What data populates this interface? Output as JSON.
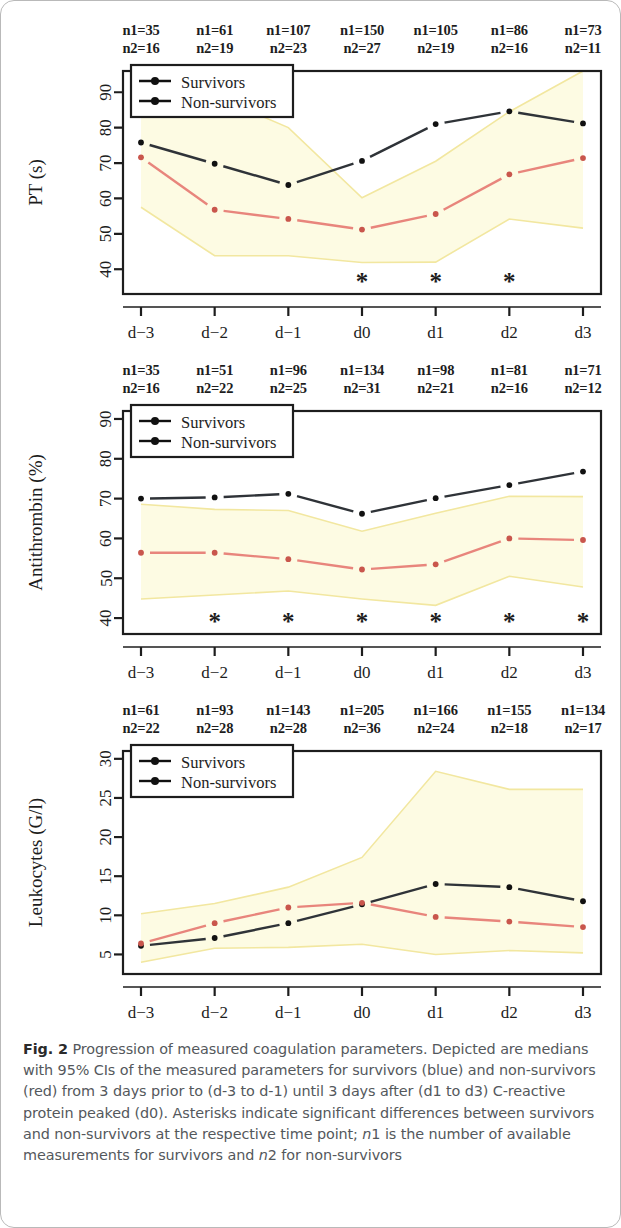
{
  "figure": {
    "label": "Fig. 2",
    "caption_parts": [
      "Progression of measured coagulation parameters. Depicted are medians with 95% CIs of the measured parameters for survivors (blue) and non-survivors (red) from 3 days prior to (d-3 to d-1) until 3 days after (d1 to d3) C-reactive protein peaked (d0). Asterisks indicate significant differences between survivors and non-survivors at the respective time point; ",
      "n",
      "1 is the number of available measurements for survivors and ",
      "n",
      "2 for non-survivors"
    ],
    "caption_full": "Progression of measured coagulation parameters. Depicted are medians with 95% CIs of the measured parameters for survivors (blue) and non-survivors (red) from 3 days prior to (d-3 to d-1) until 3 days after (d1 to d3) C-reactive protein peaked (d0). Asterisks indicate significant differences between survivors and non-survivors at the respective time point; n1 is the number of available measurements for survivors and n2 for non-survivors"
  },
  "legend": {
    "survivors": "Survivors",
    "non_survivors": "Non-survivors"
  },
  "colors": {
    "survivors_line": "#2f3338",
    "non_survivors_line": "#e8857c",
    "ci_band": "#fdfbe3",
    "ci_edge": "#f2e7a0",
    "axis": "#1d1d1d",
    "caption_text": "#54585c"
  },
  "chart_data": [
    {
      "type": "line",
      "title": "PT (s)",
      "ylabel": "PT (s)",
      "xlabel": "",
      "categories": [
        "d−3",
        "d−2",
        "d−1",
        "d0",
        "d1",
        "d2",
        "d3"
      ],
      "ylim": [
        33,
        96
      ],
      "yticks": [
        40,
        50,
        60,
        70,
        80,
        90
      ],
      "grid": false,
      "legend_position": "top-left",
      "series": [
        {
          "name": "Survivors",
          "values": [
            75.8,
            69.8,
            63.8,
            70.6,
            81.0,
            84.6,
            81.2
          ]
        },
        {
          "name": "Non-survivors",
          "values": [
            71.6,
            56.8,
            54.2,
            51.2,
            55.6,
            66.8,
            71.4
          ]
        }
      ],
      "ci_upper": [
        95.0,
        89.0,
        80.0,
        60.2,
        70.5,
        84.5,
        96.5
      ],
      "ci_lower": [
        57.5,
        43.8,
        43.8,
        41.9,
        42.0,
        54.2,
        51.6
      ],
      "n1": [
        35,
        61,
        107,
        150,
        105,
        86,
        73
      ],
      "n2": [
        16,
        19,
        23,
        27,
        19,
        16,
        11
      ],
      "significant": [
        false,
        false,
        false,
        true,
        true,
        true,
        false
      ],
      "asterisk": "*"
    },
    {
      "type": "line",
      "title": "Antithrombin (%)",
      "ylabel": "Antithrombin (%)",
      "xlabel": "",
      "categories": [
        "d−3",
        "d−2",
        "d−1",
        "d0",
        "d1",
        "d2",
        "d3"
      ],
      "ylim": [
        36,
        92
      ],
      "yticks": [
        40,
        50,
        60,
        70,
        80,
        90
      ],
      "grid": false,
      "legend_position": "top-left",
      "series": [
        {
          "name": "Survivors",
          "values": [
            70.0,
            70.3,
            71.2,
            66.2,
            70.1,
            73.4,
            76.8
          ]
        },
        {
          "name": "Non-survivors",
          "values": [
            56.4,
            56.4,
            54.8,
            52.2,
            53.5,
            60.0,
            59.6
          ]
        }
      ],
      "ci_upper": [
        68.6,
        67.3,
        67.0,
        61.8,
        66.3,
        70.6,
        70.5
      ],
      "ci_lower": [
        44.8,
        45.8,
        46.8,
        44.8,
        43.2,
        50.5,
        47.8
      ],
      "n1": [
        35,
        51,
        96,
        134,
        98,
        81,
        71
      ],
      "n2": [
        16,
        22,
        25,
        31,
        21,
        16,
        12
      ],
      "significant": [
        false,
        true,
        true,
        true,
        true,
        true,
        true
      ],
      "asterisk": "*"
    },
    {
      "type": "line",
      "title": "Leukocytes (G/l)",
      "ylabel": "Leukocytes (G/l)",
      "xlabel": "",
      "categories": [
        "d−3",
        "d−2",
        "d−1",
        "d0",
        "d1",
        "d2",
        "d3"
      ],
      "ylim": [
        2.5,
        31
      ],
      "yticks": [
        5,
        10,
        15,
        20,
        25,
        30
      ],
      "grid": false,
      "legend_position": "top-left",
      "series": [
        {
          "name": "Survivors",
          "values": [
            6.1,
            7.1,
            9.0,
            11.4,
            14.0,
            13.6,
            11.8
          ]
        },
        {
          "name": "Non-survivors",
          "values": [
            6.4,
            9.0,
            11.0,
            11.6,
            9.8,
            9.2,
            8.5
          ]
        }
      ],
      "ci_upper": [
        10.2,
        11.5,
        13.6,
        17.4,
        28.4,
        26.1,
        26.1
      ],
      "ci_lower": [
        4.0,
        5.8,
        5.9,
        6.3,
        5.0,
        5.5,
        5.2
      ],
      "n1": [
        61,
        93,
        143,
        205,
        166,
        155,
        134
      ],
      "n2": [
        22,
        28,
        28,
        36,
        24,
        18,
        17
      ],
      "significant": [
        false,
        false,
        false,
        false,
        false,
        false,
        false
      ],
      "asterisk": "*"
    }
  ]
}
